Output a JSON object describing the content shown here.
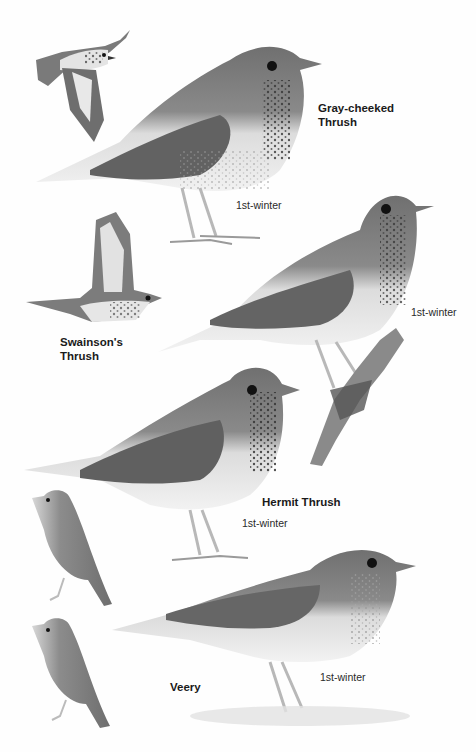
{
  "plate": {
    "background": "#fefefe",
    "palette": {
      "upperparts": "#7a7a7a",
      "upperparts_dark": "#5a5a5a",
      "underparts": "#e6e6e6",
      "spots": "#3a3a3a",
      "eye": "#111111",
      "legs": "#b8b8b8",
      "branch": "#6a6a6a"
    }
  },
  "labels": {
    "gray_cheeked": {
      "line1": "Gray-cheeked",
      "line2": "Thrush",
      "age": "1st-winter"
    },
    "swainsons": {
      "line1": "Swainson's",
      "line2": "Thrush",
      "age": "1st-winter"
    },
    "hermit": {
      "name": "Hermit Thrush",
      "age": "1st-winter"
    },
    "veery": {
      "name": "Veery",
      "age": "1st-winter"
    }
  },
  "figures": [
    {
      "id": "gray-cheeked-flight",
      "species": "Gray-cheeked Thrush",
      "pose": "flight"
    },
    {
      "id": "gray-cheeked-perched",
      "species": "Gray-cheeked Thrush",
      "pose": "standing",
      "age": "1st-winter"
    },
    {
      "id": "swainsons-flight",
      "species": "Swainson's Thrush",
      "pose": "flight"
    },
    {
      "id": "swainsons-perched",
      "species": "Swainson's Thrush",
      "pose": "perched on branch",
      "age": "1st-winter"
    },
    {
      "id": "hermit-perched",
      "species": "Hermit Thrush",
      "pose": "standing",
      "age": "1st-winter"
    },
    {
      "id": "hermit-small",
      "species": "Hermit Thrush",
      "pose": "front-facing small"
    },
    {
      "id": "veery-small",
      "species": "Veery",
      "pose": "front-facing small"
    },
    {
      "id": "veery-perched",
      "species": "Veery",
      "pose": "standing",
      "age": "1st-winter"
    }
  ]
}
